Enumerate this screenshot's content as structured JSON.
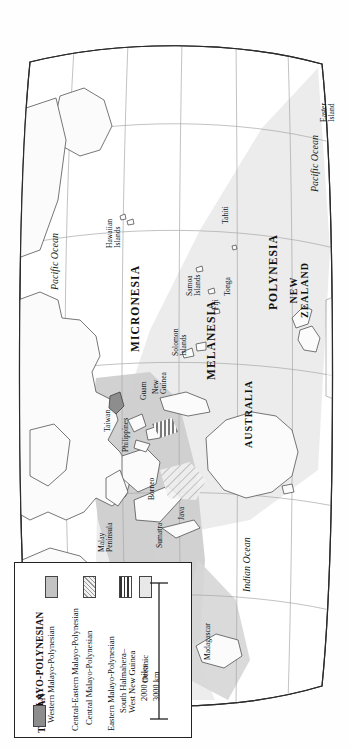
{
  "map": {
    "title": "Malayo-Polynesian language family distribution map",
    "projection_note": "oval world map, rotated 90 degrees",
    "colors": {
      "land_outline": "#3a3a3a",
      "graticule": "#9a9a9a",
      "frame": "#2b2b2b",
      "western_malayo_polynesian": "#c9c9c9",
      "central_malayo_polynesian": "#e2e2e2",
      "oceanic": "#e8e8e8",
      "taiwan": "#8d8d8d",
      "ocean": "#ffffff",
      "background": "#fefefe"
    },
    "regions": [
      {
        "id": "micronesia",
        "label": "MICRONESIA"
      },
      {
        "id": "melanesia",
        "label": "MELANESIA"
      },
      {
        "id": "polynesia",
        "label": "POLYNESIA"
      }
    ],
    "countries": [
      {
        "id": "australia",
        "label": "AUSTRALIA"
      },
      {
        "id": "new-zealand",
        "label": "NEW\nZEALAND"
      }
    ],
    "places": [
      {
        "id": "taiwan",
        "label": "Taiwan"
      },
      {
        "id": "philippines",
        "label": "Philippines"
      },
      {
        "id": "guam",
        "label": "Guam"
      },
      {
        "id": "borneo",
        "label": "Borneo"
      },
      {
        "id": "java",
        "label": "Java"
      },
      {
        "id": "sumatra",
        "label": "Sumatra"
      },
      {
        "id": "malay-peninsula",
        "label": "Malay\nPeninsula"
      },
      {
        "id": "new-guinea",
        "label": "New\nGuinea"
      },
      {
        "id": "solomon-islands",
        "label": "Solomon\nIslands"
      },
      {
        "id": "hawaiian-islands",
        "label": "Hawaiian\nIslands"
      },
      {
        "id": "samoa-islands",
        "label": "Samoa\nIslands"
      },
      {
        "id": "fiji",
        "label": "Fiji"
      },
      {
        "id": "tonga",
        "label": "Tonga"
      },
      {
        "id": "tahiti",
        "label": "Tahiti"
      },
      {
        "id": "easter-island",
        "label": "Easter\nIsland"
      },
      {
        "id": "madagascar",
        "label": "Madagascar"
      }
    ],
    "oceans": [
      {
        "id": "pacific-ocean-west",
        "label": "Pacific Ocean"
      },
      {
        "id": "pacific-ocean-east",
        "label": "Pacific Ocean"
      },
      {
        "id": "indian-ocean",
        "label": "Indian Ocean"
      }
    ]
  },
  "legend": {
    "title": "MALAYO-POLYNESIAN",
    "entries": [
      {
        "id": "western-malayo-polynesian",
        "label": "Western Malayo-Polynesian",
        "swatch": "solid-gray",
        "color": "#c3c3c3"
      },
      {
        "id": "central-eastern-malayo-polynesian",
        "label": "Central-Eastern Malayo-Polynesian",
        "swatch": "none",
        "color": ""
      },
      {
        "id": "central-malayo-polynesian",
        "label": "Central Malayo-Polynesian",
        "swatch": "diagonal-hatch",
        "color": "#f0f0f0"
      },
      {
        "id": "eastern-malayo-polynesian",
        "label": "Eastern Malayo-Polynesian",
        "swatch": "none",
        "color": ""
      },
      {
        "id": "south-halmahera-west-new-guinea",
        "label": "South Halmahera–\nWest New Guinea",
        "swatch": "vertical-stripes",
        "color": "#ffffff"
      },
      {
        "id": "oceanic",
        "label": "Oceanic",
        "swatch": "light-gray",
        "color": "#e8e8e8"
      }
    ],
    "secondary_title": "TAIWAN",
    "secondary_entry": {
      "id": "taiwan",
      "label": "",
      "swatch": "solid-dark",
      "color": "#8d8d8d"
    },
    "scale": {
      "miles_label": "2000 miles",
      "km_label": "3000 km"
    }
  }
}
